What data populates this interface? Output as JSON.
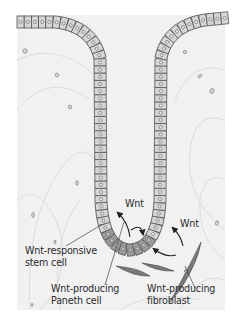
{
  "figure": {
    "type": "intestinal crypt schematic",
    "colors": {
      "tissue_background": "#f1f1f1",
      "cell_fill": "#d6d6d6",
      "cell_outline": "#555555",
      "paneth_cell_fill": "#9a9a9a",
      "fibroblast_fill": "#7a7a7a",
      "arrow": "#222222",
      "leader_line": "#444444"
    }
  },
  "labels": {
    "wnt_center": "Wnt",
    "wnt_right": "Wnt",
    "stem_cell_line1": "Wnt-responsive",
    "stem_cell_line2": "stem cell",
    "paneth_line1": "Wnt-producing",
    "paneth_line2": "Paneth cell",
    "fibroblast_line1": "Wnt-producing",
    "fibroblast_line2": "fibroblast"
  }
}
